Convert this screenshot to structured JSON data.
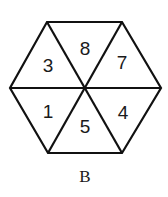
{
  "figure": {
    "caption": "B",
    "shape": "hexagon",
    "segments": [
      {
        "position": "upper-left",
        "label": "3"
      },
      {
        "position": "top",
        "label": "8"
      },
      {
        "position": "upper-right",
        "label": "7"
      },
      {
        "position": "lower-right",
        "label": "4"
      },
      {
        "position": "bottom",
        "label": "5"
      },
      {
        "position": "lower-left",
        "label": "1"
      }
    ]
  }
}
